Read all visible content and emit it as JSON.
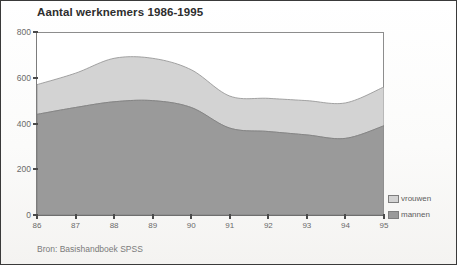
{
  "figure": {
    "title": "Aantal werknemers 1986-1995",
    "source_note": "Bron: Basishandboek SPSS"
  },
  "legend": {
    "position": "right-bottom",
    "items": [
      {
        "label": "vrouwen",
        "color": "#d3d3d3",
        "icon": "legend-swatch-icon"
      },
      {
        "label": "mannen",
        "color": "#9a9a9a",
        "icon": "legend-swatch-icon"
      }
    ]
  },
  "axes": {
    "y_ticks": [
      "800",
      "600",
      "400",
      "200",
      "0"
    ],
    "x_ticks": [
      "86",
      "87",
      "88",
      "89",
      "90",
      "91",
      "92",
      "93",
      "94",
      "95"
    ]
  },
  "chart_data": {
    "type": "area",
    "stacked": true,
    "title": "Aantal werknemers 1986-1995",
    "subtitle": "",
    "xlabel": "",
    "ylabel": "",
    "source": "Bron: Basishandboek SPSS",
    "grid": false,
    "legend_position": "right-bottom",
    "categories": [
      "86",
      "87",
      "88",
      "89",
      "90",
      "91",
      "92",
      "93",
      "94",
      "95"
    ],
    "x": [
      1986,
      1987,
      1988,
      1989,
      1990,
      1991,
      1992,
      1993,
      1994,
      1995
    ],
    "xlim": [
      1986,
      1995
    ],
    "ylim": [
      0,
      800
    ],
    "yticks": [
      0,
      200,
      400,
      600,
      800
    ],
    "xticks": [
      1986,
      1987,
      1988,
      1989,
      1990,
      1991,
      1992,
      1993,
      1994,
      1995
    ],
    "series": [
      {
        "name": "mannen",
        "color": "#9a9a9a",
        "values": [
          440,
          470,
          495,
          500,
          470,
          380,
          365,
          350,
          335,
          390
        ]
      },
      {
        "name": "vrouwen",
        "color": "#d3d3d3",
        "values": [
          130,
          150,
          190,
          185,
          165,
          140,
          145,
          150,
          155,
          170
        ]
      }
    ],
    "totals": [
      570,
      620,
      685,
      685,
      635,
      520,
      510,
      500,
      490,
      560
    ]
  }
}
